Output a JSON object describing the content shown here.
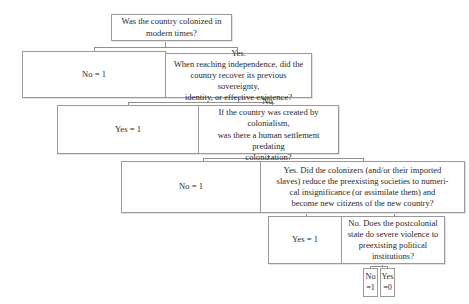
{
  "diagram": {
    "type": "decision-tree",
    "root": {
      "question": "Was the country colonized in\nmodern times?"
    },
    "level1": {
      "no_outcome": "No = 1",
      "yes_question": "Yes.\nWhen reaching independence, did the\ncountry recover its previous sovereignty,\nidentity, or effective existence?"
    },
    "level2": {
      "yes_outcome": "Yes = 1",
      "no_question": "No.\nIf the country was created by colonialism,\nwas there a human settlement predating\ncolonization?"
    },
    "level3": {
      "no_outcome": "No = 1",
      "yes_question": "Yes. Did the colonizers (and/or their imported\nslaves) reduce the preexisting societies to numeri-\ncal insignificance (or assimilate them) and\nbecome new citizens of the new country?"
    },
    "level4": {
      "yes_outcome": "Yes = 1",
      "no_question": "No. Does the postcolonial\nstate do severe violence to\npreexisting political\ninstitutions?"
    },
    "leaves": {
      "no_outcome": "No\n=1",
      "yes_outcome": "Yes\n=0"
    }
  }
}
